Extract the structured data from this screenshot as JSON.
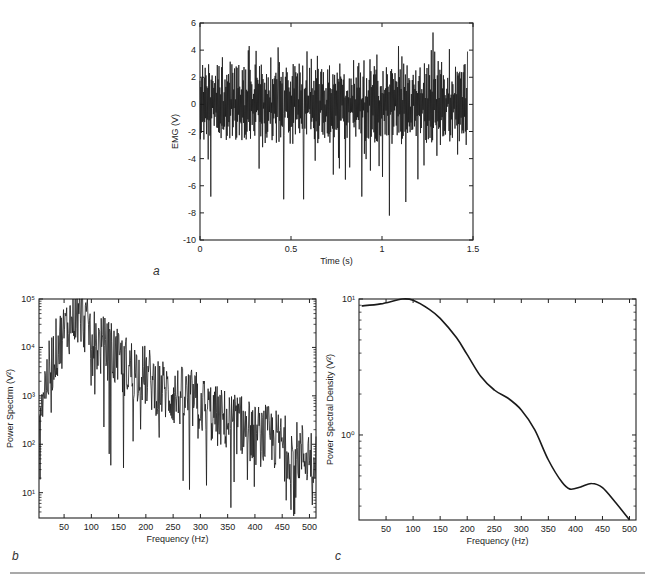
{
  "figure": {
    "separator_color": "#555555",
    "line_color": "#1a1a1a"
  },
  "chart_data": [
    {
      "id": "a",
      "type": "line",
      "panel_label": "a",
      "title": "",
      "xlabel": "Time (s)",
      "ylabel": "EMG (V)",
      "xlim": [
        0,
        1.5
      ],
      "ylim": [
        -10,
        6
      ],
      "xticks": [
        0,
        0.5,
        1,
        1.5
      ],
      "xtick_labels": [
        "0",
        "0.5",
        "1",
        "1.5"
      ],
      "yticks": [
        -10,
        -8,
        -6,
        -4,
        -2,
        0,
        2,
        4,
        6
      ],
      "ytick_labels": [
        "-10",
        "-8",
        "-6",
        "-4",
        "-2",
        "0",
        "2",
        "4",
        "6"
      ],
      "grid": false,
      "description": "Raw EMG signal, dense oscillation around 0 V between ~-8 and ~5.3 V over 1.47 s",
      "notable_peaks": [
        {
          "x": 0.57,
          "y": 5.0
        },
        {
          "x": 1.28,
          "y": 5.3
        },
        {
          "x": 0.27,
          "y": 4.3
        },
        {
          "x": 1.09,
          "y": 4.3
        },
        {
          "x": 0.43,
          "y": 4.2
        }
      ],
      "notable_troughs": [
        {
          "x": 0.06,
          "y": -6.8
        },
        {
          "x": 0.46,
          "y": -7.0
        },
        {
          "x": 0.57,
          "y": -7.0
        },
        {
          "x": 0.89,
          "y": -6.8
        },
        {
          "x": 1.04,
          "y": -8.2
        },
        {
          "x": 1.13,
          "y": -7.2
        }
      ],
      "x_end": 1.47
    },
    {
      "id": "b",
      "type": "line",
      "panel_label": "b",
      "title": "",
      "xlabel": "Frequency (Hz)",
      "ylabel": "Power Spectrm (V²)",
      "yscale": "log",
      "xlim": [
        4,
        512
      ],
      "ylim": [
        3,
        100000
      ],
      "xticks": [
        50,
        100,
        150,
        200,
        250,
        300,
        350,
        400,
        450,
        500
      ],
      "xtick_labels": [
        "50",
        "100",
        "150",
        "200",
        "250",
        "300",
        "350",
        "400",
        "450",
        "500"
      ],
      "yticks": [
        10,
        100,
        1000,
        10000,
        100000
      ],
      "ytick_labels": [
        "10¹",
        "10²",
        "10³",
        "10⁴",
        "10⁵"
      ],
      "grid": false,
      "description": "Noisy power spectrum; rises from ~10³ at low frequency to peak ~10⁵ near 70-80 Hz, then decays to ~10² by 450-500 Hz",
      "envelope": {
        "x": [
          5,
          20,
          35,
          50,
          65,
          75,
          90,
          110,
          130,
          150,
          175,
          200,
          225,
          250,
          275,
          300,
          325,
          350,
          375,
          400,
          425,
          450,
          475,
          500,
          512
        ],
        "y": [
          700,
          2500,
          9000,
          20000,
          40000,
          60000,
          30000,
          12000,
          9000,
          5000,
          3500,
          2500,
          1500,
          1000,
          900,
          700,
          400,
          300,
          250,
          150,
          150,
          100,
          70,
          60,
          60
        ]
      }
    },
    {
      "id": "c",
      "type": "line",
      "panel_label": "c",
      "title": "",
      "xlabel": "Frequency (Hz)",
      "ylabel": "Power Spectral Density (V²)",
      "yscale": "log",
      "xlim": [
        0,
        512
      ],
      "ylim": [
        0.237,
        10
      ],
      "xticks": [
        50,
        100,
        150,
        200,
        250,
        300,
        350,
        400,
        450,
        500
      ],
      "xtick_labels": [
        "50",
        "100",
        "150",
        "200",
        "250",
        "300",
        "350",
        "400",
        "450",
        "500"
      ],
      "yticks": [
        1,
        10
      ],
      "ytick_labels": [
        "10⁰",
        "10¹"
      ],
      "grid": false,
      "x": [
        5,
        40,
        80,
        100,
        130,
        150,
        180,
        200,
        225,
        250,
        275,
        300,
        325,
        350,
        375,
        390,
        410,
        430,
        450,
        475,
        500
      ],
      "y": [
        8.9,
        9.2,
        10.0,
        9.8,
        8.4,
        7.2,
        5.2,
        3.9,
        2.7,
        2.14,
        1.87,
        1.53,
        1.09,
        0.655,
        0.45,
        0.4,
        0.415,
        0.44,
        0.41,
        0.316,
        0.237
      ]
    }
  ]
}
